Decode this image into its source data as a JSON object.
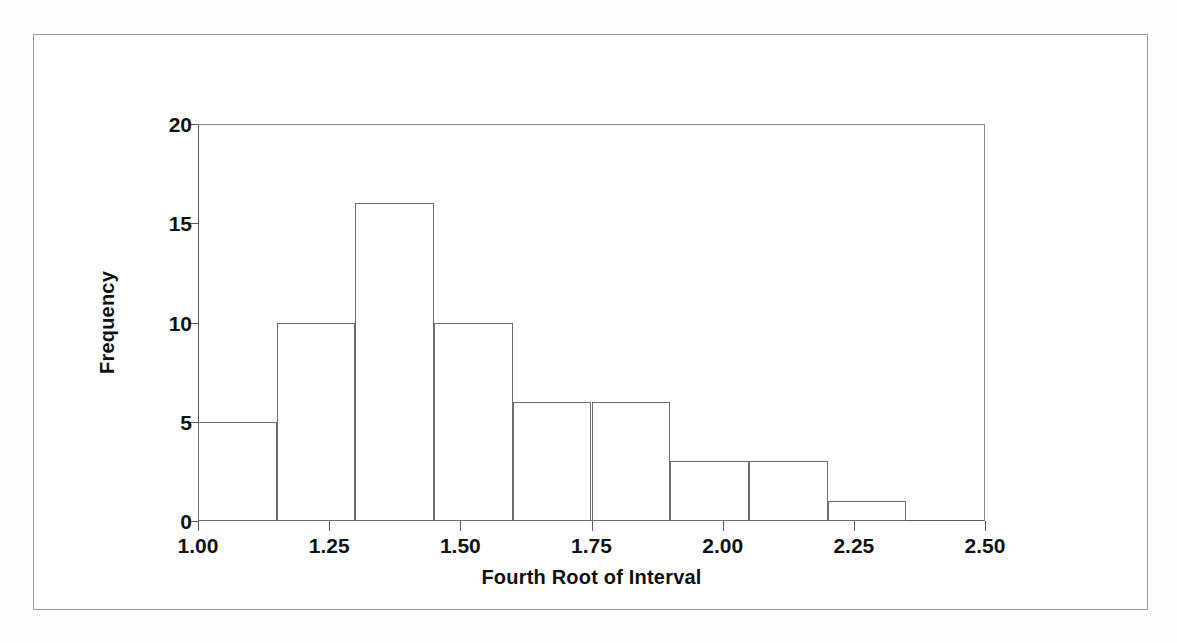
{
  "figure": {
    "background_color": "#ffffff",
    "line_color": "#5a5a5a",
    "text_color": "#121212"
  },
  "chart_data": {
    "type": "bar",
    "chart_subtype": "histogram",
    "title": "",
    "xlabel": "Fourth Root of Interval",
    "ylabel": "Frequency",
    "xlim": [
      1.0,
      2.5
    ],
    "ylim": [
      0,
      20
    ],
    "grid": false,
    "legend": null,
    "bin_width": 0.15,
    "bin_edges": [
      1.0,
      1.15,
      1.3,
      1.45,
      1.6,
      1.75,
      1.9,
      2.05,
      2.2,
      2.35
    ],
    "categories": [
      "1.00-1.15",
      "1.15-1.30",
      "1.30-1.45",
      "1.45-1.60",
      "1.60-1.75",
      "1.75-1.90",
      "1.90-2.05",
      "2.05-2.20",
      "2.20-2.35"
    ],
    "values": [
      5,
      10,
      16,
      10,
      6,
      6,
      3,
      3,
      1
    ],
    "total_count": 60,
    "xticks": [
      1.0,
      1.25,
      1.5,
      1.75,
      2.0,
      2.25,
      2.5
    ],
    "xticklabels": [
      "1.00",
      "1.25",
      "1.50",
      "1.75",
      "2.00",
      "2.25",
      "2.50"
    ],
    "yticks": [
      0,
      5,
      10,
      15,
      20
    ],
    "yticklabels": [
      "0",
      "5",
      "10",
      "15",
      "20"
    ]
  }
}
